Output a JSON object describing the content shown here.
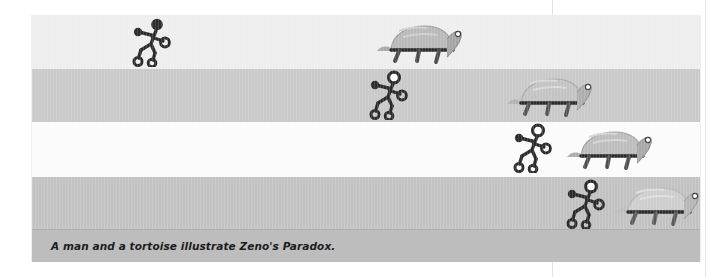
{
  "figure": {
    "caption": "A man and a tortoise illustrate Zeno's Paradox.",
    "background_color": "#ffffff",
    "caption_bar_color": "#bdbdbd",
    "caption_text_color": "#1c1c1c",
    "ink_color": "#2b2b2b",
    "shell_color": "#b9b9b9",
    "bands": [
      {
        "index": 0,
        "color": "#eeeeee",
        "tone": "light",
        "runner": {
          "label": "running-man",
          "x_pct": 14.5,
          "head_filled": true,
          "scale": 1.0
        },
        "tortoise": {
          "label": "tortoise",
          "x_pct": 51.0,
          "scale": 1.0
        },
        "gap_label": "largest gap"
      },
      {
        "index": 1,
        "color": "#c9c9c9",
        "tone": "medium",
        "runner": {
          "label": "running-man",
          "x_pct": 50.0,
          "head_filled": false,
          "scale": 1.0
        },
        "tortoise": {
          "label": "tortoise",
          "x_pct": 70.5,
          "scale": 1.0
        },
        "gap_label": "smaller gap"
      },
      {
        "index": 2,
        "color": "#fbfbfb",
        "tone": "white",
        "runner": {
          "label": "running-man",
          "x_pct": 71.5,
          "head_filled": false,
          "scale": 1.0
        },
        "tortoise": {
          "label": "tortoise",
          "x_pct": 79.5,
          "scale": 1.0
        },
        "gap_label": "smaller still"
      },
      {
        "index": 3,
        "color": "#c2c2c2",
        "tone": "medium",
        "runner": {
          "label": "running-man",
          "x_pct": 79.5,
          "head_filled": false,
          "scale": 1.0
        },
        "tortoise": {
          "label": "tortoise",
          "x_pct": 86.5,
          "scale": 1.0
        },
        "gap_label": "nearly closed"
      }
    ]
  },
  "icons": {
    "runner": "running-man-icon",
    "tortoise": "tortoise-icon"
  }
}
